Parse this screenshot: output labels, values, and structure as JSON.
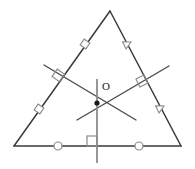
{
  "figure": {
    "kind": "geometry-diagram",
    "title_text": "",
    "width": 195,
    "height": 169,
    "background_color": "#ffffff",
    "stroke_color": "#3a3a3a",
    "mark_color": "#8a8a8a",
    "bisector_color": "#4a4a4a",
    "vertical_color": "#8c8c8c",
    "point_color": "#1a1a1a"
  },
  "labels": {
    "circumcenter": "O"
  },
  "triangle": {
    "name": "main-triangle",
    "vertices": {
      "apex": {
        "x": 110,
        "y": 11
      },
      "bottom_left": {
        "x": 14,
        "y": 146
      },
      "bottom_right": {
        "x": 181,
        "y": 146
      }
    },
    "sides": [
      {
        "name": "left-side",
        "from": "apex",
        "to": "bottom_left",
        "tick_glyph": "square",
        "tick_count": 2
      },
      {
        "name": "right-side",
        "from": "apex",
        "to": "bottom_right",
        "tick_glyph": "triangle",
        "tick_count": 2
      },
      {
        "name": "base-side",
        "from": "bottom_left",
        "to": "bottom_right",
        "tick_glyph": "circle",
        "tick_count": 2
      }
    ]
  },
  "center_point": {
    "name": "circumcenter-point",
    "x": 97,
    "y": 103,
    "radius": 2.6
  },
  "bisectors": [
    {
      "name": "left-perpendicular-bisector",
      "x1": 44,
      "y1": 65,
      "x2": 136,
      "y2": 120,
      "foot": {
        "x": 62,
        "y": 78
      },
      "right_angle_mark": true
    },
    {
      "name": "right-perpendicular-bisector",
      "x1": 169,
      "y1": 66,
      "x2": 77,
      "y2": 120,
      "foot": {
        "x": 146,
        "y": 79
      },
      "right_angle_mark": true
    },
    {
      "name": "base-perpendicular-bisector",
      "x1": 97,
      "y1": 79,
      "x2": 97,
      "y2": 163,
      "foot": {
        "x": 97,
        "y": 146
      },
      "right_angle_mark": true
    }
  ],
  "side_marks": [
    {
      "name": "left-side-upper-square-mark",
      "glyph": "square",
      "x": 85,
      "y": 44,
      "angle": -54.6,
      "size": 7
    },
    {
      "name": "left-side-lower-square-mark",
      "glyph": "square",
      "x": 39,
      "y": 109,
      "angle": -54.6,
      "size": 7
    },
    {
      "name": "right-side-upper-triangle-mark",
      "glyph": "triangle",
      "x": 127,
      "y": 44,
      "angle": 63.7,
      "size": 8
    },
    {
      "name": "right-side-lower-triangle-mark",
      "glyph": "triangle",
      "x": 160,
      "y": 108,
      "angle": 63.7,
      "size": 8
    },
    {
      "name": "base-left-circle-mark",
      "glyph": "circle",
      "x": 58,
      "y": 146,
      "size": 4
    },
    {
      "name": "base-right-circle-mark",
      "glyph": "circle",
      "x": 139,
      "y": 146,
      "size": 4
    }
  ],
  "right_angle_marks": [
    {
      "name": "right-angle-mark-left-side",
      "x": 62,
      "y": 78,
      "angle": -54.6,
      "size": 9
    },
    {
      "name": "right-angle-mark-right-side",
      "x": 146,
      "y": 79,
      "angle": 63.7,
      "size": 9
    },
    {
      "name": "right-angle-mark-base",
      "x": 97,
      "y": 146,
      "angle": 0,
      "size": 10
    }
  ],
  "center_label_position": {
    "left": 102,
    "top": 81
  }
}
